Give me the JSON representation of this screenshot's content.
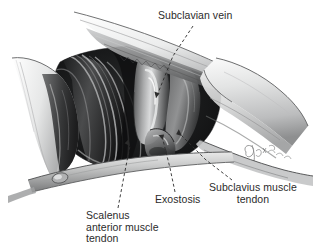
{
  "figure": {
    "kind": "surgical-anatomy-illustration",
    "medium": "grayscale pencil drawing",
    "background_color": "#ffffff",
    "ink_color": "#2b2b2b",
    "signature": "artist-signature"
  },
  "labels": {
    "subclavian_vein": {
      "text": "Subclavian vein",
      "lines": [
        "Subclavian vein"
      ],
      "align": "left"
    },
    "exostosis": {
      "text": "Exostosis",
      "lines": [
        "Exostosis"
      ],
      "align": "center"
    },
    "subclavius_muscle_tendon": {
      "text": "Subclavius muscle tendon",
      "lines": [
        "Subclavius muscle",
        "tendon"
      ],
      "align": "center"
    },
    "scalenus_anterior_muscle_tendon": {
      "text": "Scalenus anterior muscle tendon",
      "lines": [
        "Scalenus",
        "anterior muscle",
        "tendon"
      ],
      "align": "left"
    }
  },
  "leader_lines": [
    {
      "name": "leader-subclavian-vein",
      "from_label": "subclavian_vein",
      "style": "dashed",
      "arrow": true
    },
    {
      "name": "leader-exostosis",
      "from_label": "exostosis",
      "style": "dashed",
      "arrow": true
    },
    {
      "name": "leader-subclavius",
      "from_label": "subclavius_muscle_tendon",
      "style": "dashed",
      "arrow": true
    },
    {
      "name": "leader-scalenus",
      "from_label": "scalenus_anterior_muscle_tendon",
      "style": "dashed",
      "arrow": true
    }
  ],
  "structures": [
    {
      "name": "upper-tissue-flap",
      "tone": "#f3f3f3"
    },
    {
      "name": "left-tissue-flap",
      "tone": "#ededed"
    },
    {
      "name": "clavicle",
      "tone": "#f0f0f0"
    },
    {
      "name": "surgical-field-cavity",
      "tone": "#1d1d1d"
    },
    {
      "name": "scalenus-anterior-muscle",
      "tone": "#4a4a4a"
    },
    {
      "name": "subclavian-vein",
      "tone": "#9a9a9a"
    },
    {
      "name": "subclavius-muscle-tendon",
      "tone": "#5a5a5a"
    },
    {
      "name": "exostosis",
      "tone": "#6e6e6e"
    },
    {
      "name": "first-rib",
      "tone": "#d8d8d8"
    }
  ]
}
